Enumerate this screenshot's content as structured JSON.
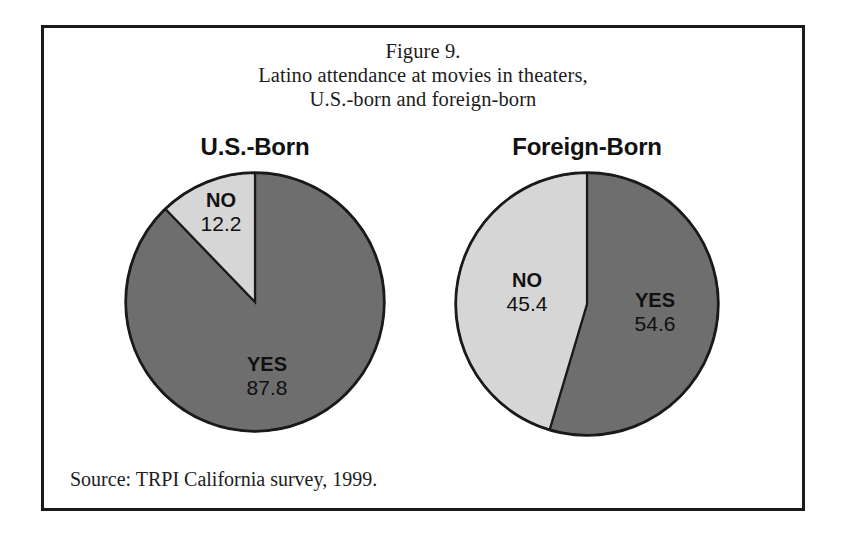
{
  "figure": {
    "title_lines": [
      "Figure 9.",
      "Latino attendance at movies in theaters,",
      "U.S.-born and foreign-born"
    ],
    "title_line_1": "Figure 9.",
    "title_line_2": "Latino attendance at movies in theaters,",
    "title_line_3": "U.S.-born and foreign-born",
    "source": "Source: TRPI California survey, 1999.",
    "border_color": "#1a1a1a",
    "background": "#ffffff"
  },
  "panels": [
    {
      "id": "us",
      "title": "U.S.-Born"
    },
    {
      "id": "foreign",
      "title": "Foreign-Born"
    }
  ],
  "panel_us_title": "U.S.-Born",
  "panel_fb_title": "Foreign-Born",
  "labels": {
    "us_no_name": "NO",
    "us_no_value": "12.2",
    "us_yes_name": "YES",
    "us_yes_value": "87.8",
    "fb_no_name": "NO",
    "fb_no_value": "45.4",
    "fb_yes_name": "YES",
    "fb_yes_value": "54.6"
  },
  "colors": {
    "yes_slice": "#6e6e6e",
    "no_slice": "#d6d6d6",
    "outline": "#1a1a1a",
    "text": "#101010"
  },
  "chart_data": [
    {
      "type": "pie",
      "title": "U.S.-Born",
      "categories": [
        "YES",
        "NO"
      ],
      "values": [
        87.8,
        12.2
      ],
      "units": "percent",
      "colors": [
        "#6e6e6e",
        "#d6d6d6"
      ],
      "start_angle_deg": 0,
      "direction": "clockwise",
      "legend": "none",
      "labels_inside": true
    },
    {
      "type": "pie",
      "title": "Foreign-Born",
      "categories": [
        "YES",
        "NO"
      ],
      "values": [
        54.6,
        45.4
      ],
      "units": "percent",
      "colors": [
        "#6e6e6e",
        "#d6d6d6"
      ],
      "start_angle_deg": 0,
      "direction": "clockwise",
      "legend": "none",
      "labels_inside": true
    }
  ]
}
